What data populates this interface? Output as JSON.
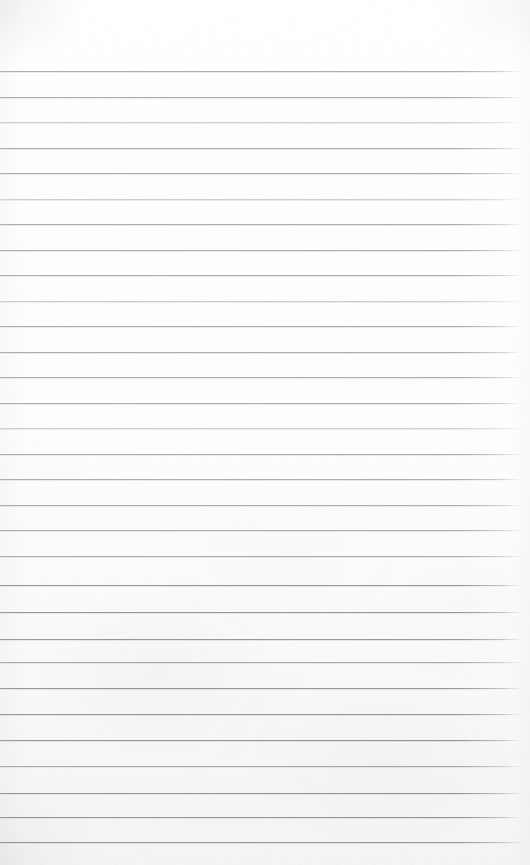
{
  "document": {
    "kind": "lined-notepad-page",
    "title": "Blank ruled notepad page",
    "content_text": "",
    "is_blank": true,
    "width_px": 530,
    "height_px": 865
  },
  "paper": {
    "base_color": "#fdfdfd",
    "top_tone": "#ffffff",
    "bottom_tone": "#f4f4f3",
    "texture": "fibrous scanned paper, light speckle, mottled toward lower half",
    "left_margin_px": 0,
    "right_margin_px": 8
  },
  "rules": {
    "line_color": "#969a9e",
    "line_color_dark": "#888c91",
    "line_color_light": "#a8acb0",
    "line_thickness_px": 1,
    "line_spacing_px": 25.5,
    "first_line_y_px": 71,
    "line_start_x_px": 0,
    "line_end_x_px": 522,
    "count": 31,
    "positions_y_px": [
      71,
      97,
      122,
      148,
      173,
      199,
      224,
      250,
      275,
      301,
      326,
      352,
      377,
      403,
      428,
      454,
      479,
      505,
      530,
      556,
      585,
      612,
      639,
      662,
      688,
      714,
      740,
      766,
      793,
      817,
      842
    ],
    "weights": [
      "normal",
      "normal",
      "light",
      "normal",
      "normal",
      "light",
      "normal",
      "normal",
      "normal",
      "light",
      "normal",
      "normal",
      "normal",
      "normal",
      "light",
      "normal",
      "normal",
      "normal",
      "normal",
      "normal",
      "dark",
      "dark",
      "dark",
      "normal",
      "dark",
      "dark",
      "dark",
      "normal",
      "dark",
      "dark",
      "dark"
    ]
  },
  "header_band": {
    "label": "unruled top margin",
    "height_px": 71
  }
}
